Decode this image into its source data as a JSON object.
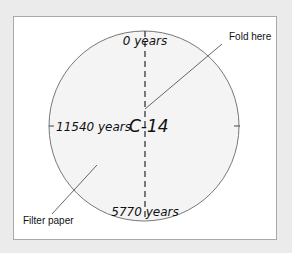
{
  "diagram": {
    "center_label": "C-14",
    "top_label": "0 years",
    "bottom_label": "5770 years",
    "left_label": "11540 years",
    "callouts": {
      "fold": "Fold here",
      "paper": "Filter paper"
    },
    "colors": {
      "background": "#ebebeb",
      "panel": "#ffffff",
      "circle_fill": "#f4f4f4",
      "stroke": "#666666"
    }
  }
}
